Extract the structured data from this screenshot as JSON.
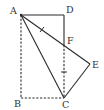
{
  "diagram": {
    "type": "geometry-figure",
    "points": {
      "A": {
        "label": "A",
        "x": 21,
        "y": 15
      },
      "B": {
        "label": "B",
        "x": 21,
        "y": 98
      },
      "C": {
        "label": "C",
        "x": 64,
        "y": 98
      },
      "D": {
        "label": "D",
        "x": 64,
        "y": 15
      },
      "E": {
        "label": "E",
        "x": 90,
        "y": 64
      },
      "F": {
        "label": "F",
        "x": 64,
        "y": 45
      }
    },
    "solid_segments": [
      "AD",
      "DF",
      "AE",
      "AC",
      "CE"
    ],
    "dashed_segments": [
      "AB",
      "BC",
      "FC"
    ],
    "equal_marks": [
      "AF",
      "FC"
    ],
    "colors": {
      "line": "#2b2b2b",
      "label": "#333333",
      "background": "#ffffff"
    }
  }
}
